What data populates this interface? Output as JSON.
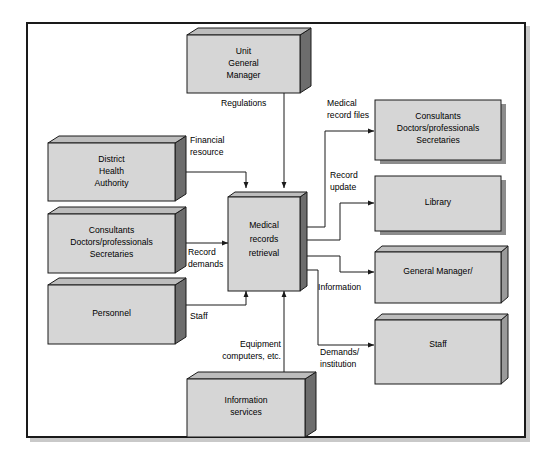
{
  "diagram": {
    "type": "data-flow-diagram",
    "colors": {
      "box_front": "#d6d6d6",
      "box_top": "#bdbdbd",
      "box_side_dark": "#6d6d6d",
      "box_side_light": "#9a9a9a",
      "drop_shadow": "#8c8c8c",
      "outline": "#1a1a1a",
      "frame_shadow": "#c9c9c9",
      "background": "#ffffff"
    },
    "nodes": [
      {
        "id": "unit-general-manager",
        "lines": [
          "Unit",
          "General",
          "Manager"
        ]
      },
      {
        "id": "district-health-authority",
        "lines": [
          "District",
          "Health",
          "Authority"
        ]
      },
      {
        "id": "consultants-left",
        "lines": [
          "Consultants",
          "Doctors/professionals",
          "Secretaries"
        ]
      },
      {
        "id": "personnel",
        "lines": [
          "Personnel"
        ]
      },
      {
        "id": "information-services",
        "lines": [
          "Information",
          "services"
        ]
      },
      {
        "id": "medical-records-retrieval",
        "lines": [
          "Medical",
          "records",
          "retrieval"
        ]
      },
      {
        "id": "consultants-right",
        "lines": [
          "Consultants",
          "Doctors/professionals",
          "Secretaries"
        ]
      },
      {
        "id": "library",
        "lines": [
          "Library"
        ]
      },
      {
        "id": "general-manager",
        "lines": [
          "General Manager/"
        ]
      },
      {
        "id": "staff-right",
        "lines": [
          "Staff"
        ]
      }
    ],
    "flows": [
      {
        "id": "regulations",
        "lines": [
          "Regulations"
        ]
      },
      {
        "id": "financial-resource",
        "lines": [
          "Financial",
          "resource"
        ]
      },
      {
        "id": "record-demands",
        "lines": [
          "Record",
          "demands"
        ]
      },
      {
        "id": "staff",
        "lines": [
          "Staff"
        ]
      },
      {
        "id": "equipment-computers",
        "lines": [
          "Equipment",
          "computers, etc."
        ]
      },
      {
        "id": "medical-record-files",
        "lines": [
          "Medical",
          "record files"
        ]
      },
      {
        "id": "record-update",
        "lines": [
          "Record",
          "update"
        ]
      },
      {
        "id": "information",
        "lines": [
          "Information"
        ]
      },
      {
        "id": "demands-institution",
        "lines": [
          "Demands/",
          "institution"
        ]
      }
    ]
  }
}
